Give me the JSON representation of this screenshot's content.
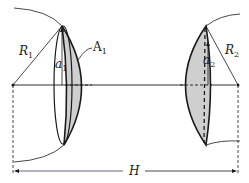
{
  "diagram": {
    "labels": {
      "R1": {
        "main": "R",
        "sub": "1"
      },
      "A1": {
        "main": "A",
        "sub": "1"
      },
      "a1": {
        "main": "a",
        "sub": "1"
      },
      "a2": {
        "main": "a",
        "sub": "2"
      },
      "R2": {
        "main": "R",
        "sub": "2"
      },
      "H": "H"
    },
    "colors": {
      "stroke": "#1a1a1a",
      "fill": "#cfcfcf",
      "background": "#ffffff"
    }
  }
}
